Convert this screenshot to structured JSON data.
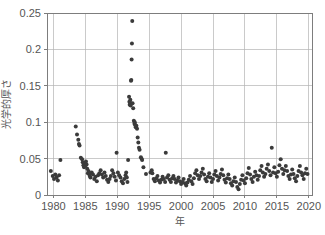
{
  "chart_data": {
    "type": "scatter",
    "title": "",
    "xlabel": "年",
    "ylabel": "光学的厚さ",
    "xlim": [
      1979,
      2020.5
    ],
    "ylim": [
      0,
      0.25
    ],
    "xticks": [
      1980,
      1985,
      1990,
      1995,
      2000,
      2005,
      2010,
      2015,
      2020
    ],
    "xticklabels": [
      "1980",
      "1985",
      "1990",
      "1995",
      "2000",
      "2005",
      "2010",
      "2015",
      "2020"
    ],
    "yticks": [
      0,
      0.05,
      0.1,
      0.15,
      0.2,
      0.25
    ],
    "yticklabels": [
      "0",
      "0.05",
      "0.1",
      "0.15",
      "0.2",
      "0.25"
    ],
    "grid": true,
    "legend": false,
    "marker_color": "#3b3b3b",
    "marker_size": 2.0,
    "series": [
      {
        "name": "光学的厚さ",
        "points": [
          [
            1979.6,
            0.033
          ],
          [
            1979.9,
            0.026
          ],
          [
            1980.1,
            0.022
          ],
          [
            1980.3,
            0.028
          ],
          [
            1980.5,
            0.024
          ],
          [
            1980.7,
            0.02
          ],
          [
            1980.9,
            0.027
          ],
          [
            1981.1,
            0.048
          ],
          [
            1983.5,
            0.094
          ],
          [
            1983.7,
            0.083
          ],
          [
            1983.9,
            0.076
          ],
          [
            1984.0,
            0.07
          ],
          [
            1984.1,
            0.068
          ],
          [
            1984.3,
            0.051
          ],
          [
            1984.5,
            0.049
          ],
          [
            1984.6,
            0.045
          ],
          [
            1984.7,
            0.041
          ],
          [
            1984.8,
            0.038
          ],
          [
            1984.9,
            0.044
          ],
          [
            1985.0,
            0.04
          ],
          [
            1985.1,
            0.046
          ],
          [
            1985.2,
            0.042
          ],
          [
            1985.3,
            0.036
          ],
          [
            1985.4,
            0.03
          ],
          [
            1985.5,
            0.033
          ],
          [
            1985.6,
            0.029
          ],
          [
            1985.7,
            0.026
          ],
          [
            1985.8,
            0.024
          ],
          [
            1986.0,
            0.031
          ],
          [
            1986.2,
            0.028
          ],
          [
            1986.4,
            0.022
          ],
          [
            1986.6,
            0.025
          ],
          [
            1986.8,
            0.019
          ],
          [
            1987.0,
            0.027
          ],
          [
            1987.2,
            0.03
          ],
          [
            1987.4,
            0.034
          ],
          [
            1987.6,
            0.028
          ],
          [
            1987.8,
            0.024
          ],
          [
            1988.0,
            0.031
          ],
          [
            1988.2,
            0.026
          ],
          [
            1988.4,
            0.021
          ],
          [
            1988.6,
            0.018
          ],
          [
            1988.8,
            0.022
          ],
          [
            1989.0,
            0.026
          ],
          [
            1989.2,
            0.034
          ],
          [
            1989.4,
            0.03
          ],
          [
            1989.6,
            0.025
          ],
          [
            1989.8,
            0.02
          ],
          [
            1989.9,
            0.058
          ],
          [
            1990.1,
            0.031
          ],
          [
            1990.3,
            0.027
          ],
          [
            1990.5,
            0.024
          ],
          [
            1990.7,
            0.019
          ],
          [
            1990.9,
            0.016
          ],
          [
            1991.1,
            0.022
          ],
          [
            1991.3,
            0.027
          ],
          [
            1991.4,
            0.031
          ],
          [
            1991.5,
            0.024
          ],
          [
            1991.6,
            0.018
          ],
          [
            1991.7,
            0.048
          ],
          [
            1991.85,
            0.135
          ],
          [
            1991.9,
            0.128
          ],
          [
            1991.95,
            0.124
          ],
          [
            1992.0,
            0.127
          ],
          [
            1992.05,
            0.131
          ],
          [
            1992.1,
            0.123
          ],
          [
            1992.15,
            0.157
          ],
          [
            1992.2,
            0.158
          ],
          [
            1992.25,
            0.186
          ],
          [
            1992.3,
            0.208
          ],
          [
            1992.35,
            0.239
          ],
          [
            1992.4,
            0.126
          ],
          [
            1992.5,
            0.119
          ],
          [
            1992.6,
            0.102
          ],
          [
            1992.7,
            0.098
          ],
          [
            1992.75,
            0.1
          ],
          [
            1992.8,
            0.096
          ],
          [
            1992.9,
            0.093
          ],
          [
            1993.0,
            0.095
          ],
          [
            1993.1,
            0.091
          ],
          [
            1993.2,
            0.079
          ],
          [
            1993.3,
            0.072
          ],
          [
            1993.4,
            0.065
          ],
          [
            1993.5,
            0.062
          ],
          [
            1993.7,
            0.052
          ],
          [
            1993.8,
            0.05
          ],
          [
            1993.9,
            0.048
          ],
          [
            1994.1,
            0.038
          ],
          [
            1994.5,
            0.029
          ],
          [
            1995.2,
            0.031
          ],
          [
            1995.4,
            0.034
          ],
          [
            1995.5,
            0.03
          ],
          [
            1995.7,
            0.022
          ],
          [
            1995.9,
            0.019
          ],
          [
            1996.1,
            0.023
          ],
          [
            1996.3,
            0.026
          ],
          [
            1996.5,
            0.02
          ],
          [
            1996.7,
            0.017
          ],
          [
            1996.9,
            0.021
          ],
          [
            1997.1,
            0.025
          ],
          [
            1997.3,
            0.022
          ],
          [
            1997.5,
            0.018
          ],
          [
            1997.6,
            0.058
          ],
          [
            1997.8,
            0.024
          ],
          [
            1998.0,
            0.027
          ],
          [
            1998.2,
            0.021
          ],
          [
            1998.4,
            0.018
          ],
          [
            1998.6,
            0.023
          ],
          [
            1998.8,
            0.026
          ],
          [
            1999.0,
            0.022
          ],
          [
            1999.2,
            0.017
          ],
          [
            1999.4,
            0.02
          ],
          [
            1999.6,
            0.024
          ],
          [
            1999.8,
            0.019
          ],
          [
            2000.0,
            0.015
          ],
          [
            2000.2,
            0.018
          ],
          [
            2000.4,
            0.022
          ],
          [
            2000.6,
            0.016
          ],
          [
            2000.8,
            0.013
          ],
          [
            2001.0,
            0.017
          ],
          [
            2001.2,
            0.021
          ],
          [
            2001.4,
            0.026
          ],
          [
            2001.6,
            0.019
          ],
          [
            2001.8,
            0.015
          ],
          [
            2002.0,
            0.023
          ],
          [
            2002.2,
            0.03
          ],
          [
            2002.4,
            0.034
          ],
          [
            2002.6,
            0.027
          ],
          [
            2002.8,
            0.022
          ],
          [
            2003.0,
            0.026
          ],
          [
            2003.2,
            0.031
          ],
          [
            2003.4,
            0.036
          ],
          [
            2003.6,
            0.028
          ],
          [
            2003.8,
            0.022
          ],
          [
            2004.0,
            0.019
          ],
          [
            2004.2,
            0.025
          ],
          [
            2004.4,
            0.03
          ],
          [
            2004.6,
            0.024
          ],
          [
            2004.8,
            0.018
          ],
          [
            2005.0,
            0.022
          ],
          [
            2005.2,
            0.028
          ],
          [
            2005.4,
            0.033
          ],
          [
            2005.6,
            0.026
          ],
          [
            2005.8,
            0.02
          ],
          [
            2006.0,
            0.024
          ],
          [
            2006.2,
            0.029
          ],
          [
            2006.4,
            0.035
          ],
          [
            2006.6,
            0.027
          ],
          [
            2006.8,
            0.021
          ],
          [
            2007.0,
            0.017
          ],
          [
            2007.2,
            0.023
          ],
          [
            2007.4,
            0.028
          ],
          [
            2007.6,
            0.022
          ],
          [
            2007.8,
            0.016
          ],
          [
            2008.0,
            0.013
          ],
          [
            2008.2,
            0.019
          ],
          [
            2008.4,
            0.024
          ],
          [
            2008.6,
            0.018
          ],
          [
            2008.8,
            0.011
          ],
          [
            2009.0,
            0.008
          ],
          [
            2009.2,
            0.015
          ],
          [
            2009.4,
            0.021
          ],
          [
            2009.6,
            0.027
          ],
          [
            2009.8,
            0.02
          ],
          [
            2010.0,
            0.016
          ],
          [
            2010.2,
            0.023
          ],
          [
            2010.4,
            0.03
          ],
          [
            2010.6,
            0.037
          ],
          [
            2010.8,
            0.028
          ],
          [
            2011.0,
            0.022
          ],
          [
            2011.2,
            0.018
          ],
          [
            2011.4,
            0.025
          ],
          [
            2011.6,
            0.032
          ],
          [
            2011.8,
            0.027
          ],
          [
            2012.0,
            0.021
          ],
          [
            2012.2,
            0.026
          ],
          [
            2012.4,
            0.034
          ],
          [
            2012.6,
            0.04
          ],
          [
            2012.8,
            0.031
          ],
          [
            2013.0,
            0.025
          ],
          [
            2013.2,
            0.029
          ],
          [
            2013.4,
            0.036
          ],
          [
            2013.6,
            0.042
          ],
          [
            2013.8,
            0.033
          ],
          [
            2014.0,
            0.027
          ],
          [
            2014.2,
            0.065
          ],
          [
            2014.4,
            0.031
          ],
          [
            2014.6,
            0.038
          ],
          [
            2014.8,
            0.03
          ],
          [
            2015.0,
            0.025
          ],
          [
            2015.2,
            0.032
          ],
          [
            2015.4,
            0.041
          ],
          [
            2015.6,
            0.049
          ],
          [
            2015.8,
            0.036
          ],
          [
            2016.0,
            0.029
          ],
          [
            2016.2,
            0.034
          ],
          [
            2016.4,
            0.04
          ],
          [
            2016.6,
            0.033
          ],
          [
            2016.8,
            0.026
          ],
          [
            2017.0,
            0.022
          ],
          [
            2017.2,
            0.028
          ],
          [
            2017.4,
            0.035
          ],
          [
            2017.6,
            0.029
          ],
          [
            2017.8,
            0.023
          ],
          [
            2018.0,
            0.019
          ],
          [
            2018.2,
            0.026
          ],
          [
            2018.4,
            0.033
          ],
          [
            2018.6,
            0.04
          ],
          [
            2018.8,
            0.031
          ],
          [
            2019.0,
            0.027
          ],
          [
            2019.2,
            0.022
          ],
          [
            2019.4,
            0.03
          ],
          [
            2019.6,
            0.036
          ],
          [
            2019.8,
            0.029
          ]
        ]
      }
    ]
  }
}
